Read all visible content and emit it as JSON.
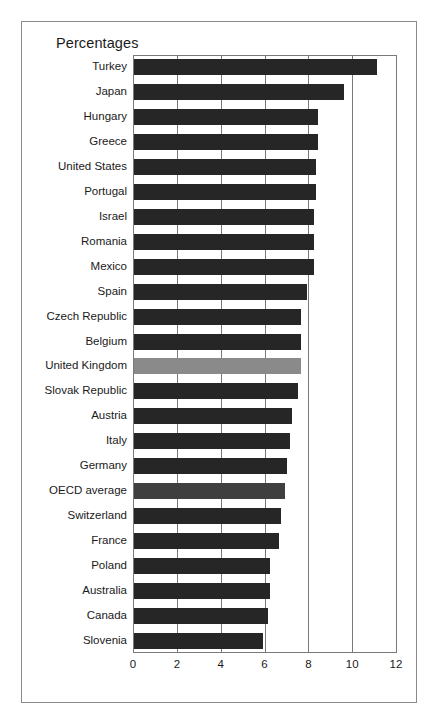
{
  "figure": {
    "title": "Percentages",
    "border_color": "#8a8a8a",
    "background": "#ffffff"
  },
  "colors": {
    "bar_default": "#262626",
    "bar_highlight_uk": "#8a8a8a",
    "bar_highlight_oecd": "#3f3f3f",
    "axis": "#7a7a7a",
    "text": "#1a1a1a"
  },
  "chart_data": {
    "type": "bar",
    "orientation": "horizontal",
    "title": "Percentages",
    "xlabel": "",
    "ylabel": "",
    "xlim": [
      0,
      12
    ],
    "xticks": [
      0,
      2,
      4,
      6,
      8,
      10,
      12
    ],
    "xticklabels": [
      "0",
      "2",
      "4",
      "6",
      "8",
      "10",
      "12"
    ],
    "grid": true,
    "legend": null,
    "categories": [
      "Turkey",
      "Japan",
      "Hungary",
      "Greece",
      "United States",
      "Portugal",
      "Israel",
      "Romania",
      "Mexico",
      "Spain",
      "Czech Republic",
      "Belgium",
      "United Kingdom",
      "Slovak Republic",
      "Austria",
      "Italy",
      "Germany",
      "OECD average",
      "Switzerland",
      "France",
      "Poland",
      "Australia",
      "Canada",
      "Slovenia"
    ],
    "values": [
      11.1,
      9.6,
      8.4,
      8.4,
      8.3,
      8.3,
      8.2,
      8.2,
      8.2,
      7.9,
      7.6,
      7.6,
      7.6,
      7.5,
      7.2,
      7.1,
      7.0,
      6.9,
      6.7,
      6.6,
      6.2,
      6.2,
      6.1,
      5.9
    ],
    "bar_colors": [
      "#262626",
      "#262626",
      "#262626",
      "#262626",
      "#262626",
      "#262626",
      "#262626",
      "#262626",
      "#262626",
      "#262626",
      "#262626",
      "#262626",
      "#8a8a8a",
      "#262626",
      "#262626",
      "#262626",
      "#262626",
      "#3f3f3f",
      "#262626",
      "#262626",
      "#262626",
      "#262626",
      "#262626",
      "#262626"
    ]
  }
}
